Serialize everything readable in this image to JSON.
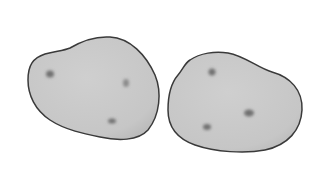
{
  "scene": {
    "description": "Two potato illustrations",
    "colors": {
      "background": "#ffffff",
      "fill": "#c9c9c9",
      "outline": "#3a3a3a",
      "eye": "#7a7a7a"
    },
    "objects": [
      {
        "name": "potato-left",
        "eyes": 3
      },
      {
        "name": "potato-right",
        "eyes": 3
      }
    ]
  }
}
